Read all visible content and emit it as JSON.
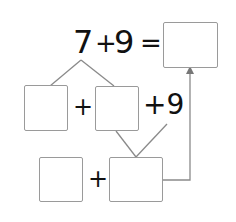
{
  "equation": {
    "left_operand": "7",
    "plus": "+",
    "right_operand": "9",
    "equals": "=",
    "answer": ""
  },
  "decomposition_row": {
    "part1": "",
    "plus": "+",
    "part2": "",
    "suffix": "+9"
  },
  "combination_row": {
    "part1": "",
    "plus": "+",
    "sum": ""
  },
  "colors": {
    "line": "#8a8a8a",
    "box_border": "#9a9a9a",
    "text": "#111111"
  }
}
